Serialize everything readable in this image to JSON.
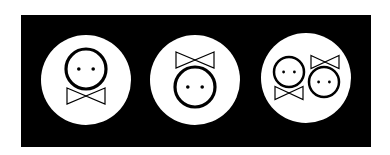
{
  "diagram": {
    "title": "",
    "background": "#ffffff",
    "panel_color": "#000000",
    "disc_color": "#ffffff",
    "ink_color": "#000000",
    "panels": [
      {
        "label": "",
        "disc": {
          "cx": 86,
          "cy": 80,
          "r": 45
        },
        "figures": [
          {
            "type": "face-with-bowtie-below",
            "head": {
              "cx": 86,
              "cy": 69,
              "r": 20
            },
            "bowtie": {
              "cx": 86,
              "cy": 96,
              "w": 38,
              "h": 16
            }
          }
        ]
      },
      {
        "label": "",
        "disc": {
          "cx": 195,
          "cy": 80,
          "r": 45
        },
        "figures": [
          {
            "type": "face-with-bowtie-above",
            "head": {
              "cx": 195,
              "cy": 87,
              "r": 20
            },
            "bowtie": {
              "cx": 195,
              "cy": 60,
              "w": 38,
              "h": 16
            }
          }
        ]
      },
      {
        "label": "",
        "disc": {
          "cx": 306,
          "cy": 78,
          "r": 45
        },
        "figures": [
          {
            "type": "face-with-bowtie-below",
            "head": {
              "cx": 289,
              "cy": 72,
              "r": 15
            },
            "bowtie": {
              "cx": 289,
              "cy": 93,
              "w": 28,
              "h": 13
            }
          },
          {
            "type": "face-with-bowtie-above",
            "head": {
              "cx": 324,
              "cy": 82,
              "r": 15
            },
            "bowtie": {
              "cx": 325,
              "cy": 62,
              "w": 28,
              "h": 13
            }
          }
        ]
      }
    ]
  }
}
